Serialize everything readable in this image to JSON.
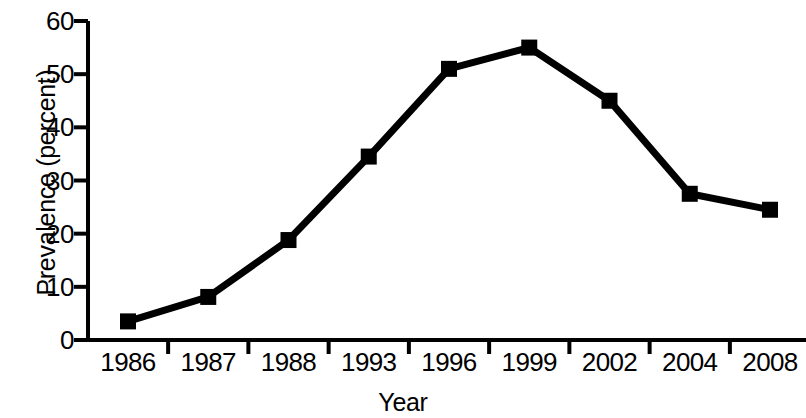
{
  "chart_data": {
    "type": "line",
    "title": "",
    "xlabel": "Year",
    "ylabel": "Prevalence (percent)",
    "categories": [
      "1986",
      "1987",
      "1988",
      "1993",
      "1996",
      "1999",
      "2002",
      "2004",
      "2008"
    ],
    "values": [
      3.5,
      8.1,
      18.8,
      34.5,
      51,
      55,
      45,
      27.5,
      24.5
    ],
    "series": [
      {
        "name": "Prevalence",
        "values": [
          3.5,
          8.1,
          18.8,
          34.5,
          51,
          55,
          45,
          27.5,
          24.5
        ]
      }
    ],
    "ylim": [
      0,
      60
    ],
    "y_ticks": [
      0,
      10,
      20,
      30,
      40,
      50,
      60
    ],
    "y_tick_labels": [
      "0",
      "10",
      "20",
      "30",
      "40",
      "50",
      "60"
    ],
    "grid": false,
    "legend": false,
    "legend_position": "none",
    "marker": "square",
    "line_color": "#000000",
    "marker_color": "#000000",
    "background_color": "#ffffff"
  }
}
